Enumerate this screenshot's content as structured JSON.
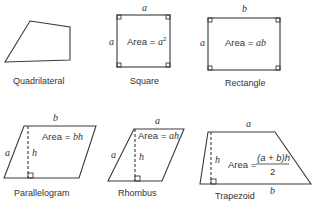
{
  "figure": {
    "shapes": [
      {
        "id": "quadrilateral",
        "caption": "Quadrilateral"
      },
      {
        "id": "square",
        "caption": "Square",
        "top": "a",
        "left": "a",
        "area_label": "Area = ",
        "area_expr": "a",
        "area_sup": "2"
      },
      {
        "id": "rectangle",
        "caption": "Rectangle",
        "top": "b",
        "left": "a",
        "area_label": "Area = ",
        "area_expr": "ab"
      },
      {
        "id": "parallelogram",
        "caption": "Parallelogram",
        "top": "b",
        "left": "a",
        "height": "h",
        "area_label": "Area = ",
        "area_expr": "bh"
      },
      {
        "id": "rhombus",
        "caption": "Rhombus",
        "top": "a",
        "left": "a",
        "height": "h",
        "area_label": "Area = ",
        "area_expr": "ah"
      },
      {
        "id": "trapezoid",
        "caption": "Trapezoid",
        "top": "a",
        "bottom": "b",
        "height": "h",
        "area_label": "Area = ",
        "area_num": "(a + b)h",
        "area_den": "2"
      }
    ]
  }
}
